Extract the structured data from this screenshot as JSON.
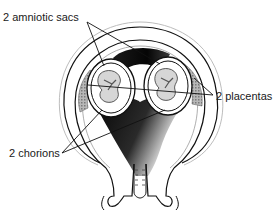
{
  "diagram": {
    "labels": {
      "amniotic_sacs": "2 amniotic sacs",
      "placentas": "2 placentas",
      "chorions": "2 chorions"
    },
    "colors": {
      "line": "#111111",
      "fill_dark": "#0d0d0d",
      "fill_light": "#ffffff",
      "placenta": "#9a9a9a",
      "fetus": "#6f6f6f"
    }
  }
}
